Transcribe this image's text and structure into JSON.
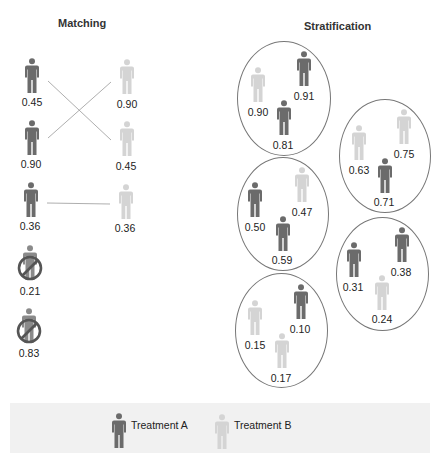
{
  "colors": {
    "treatment_a": "#6b6b6b",
    "treatment_b": "#d4d4d4",
    "line": "#888888",
    "ellipse": "#777777"
  },
  "matching": {
    "title": "Matching",
    "treatment_a": [
      {
        "value": "0.45"
      },
      {
        "value": "0.90"
      },
      {
        "value": "0.36"
      }
    ],
    "treatment_b": [
      {
        "value": "0.90"
      },
      {
        "value": "0.45"
      },
      {
        "value": "0.36"
      }
    ],
    "unmatched": [
      {
        "value": "0.21"
      },
      {
        "value": "0.83"
      }
    ],
    "links": [
      {
        "from": "A 0.45",
        "to": "B 0.45"
      },
      {
        "from": "A 0.90",
        "to": "B 0.90"
      },
      {
        "from": "A 0.36",
        "to": "B 0.36"
      }
    ]
  },
  "stratification": {
    "title": "Stratification",
    "strata": [
      {
        "members": [
          {
            "group": "B",
            "value": "0.90"
          },
          {
            "group": "A",
            "value": "0.91"
          },
          {
            "group": "A",
            "value": "0.81"
          }
        ]
      },
      {
        "members": [
          {
            "group": "B",
            "value": "0.63"
          },
          {
            "group": "B",
            "value": "0.75"
          },
          {
            "group": "A",
            "value": "0.71"
          }
        ]
      },
      {
        "members": [
          {
            "group": "A",
            "value": "0.50"
          },
          {
            "group": "B",
            "value": "0.47"
          },
          {
            "group": "A",
            "value": "0.59"
          }
        ]
      },
      {
        "members": [
          {
            "group": "A",
            "value": "0.31"
          },
          {
            "group": "A",
            "value": "0.38"
          },
          {
            "group": "B",
            "value": "0.24"
          }
        ]
      },
      {
        "members": [
          {
            "group": "B",
            "value": "0.15"
          },
          {
            "group": "A",
            "value": "0.10"
          },
          {
            "group": "B",
            "value": "0.17"
          }
        ]
      }
    ]
  },
  "legend": {
    "items": [
      {
        "label": "Treatment A",
        "icon": "person-icon-dark"
      },
      {
        "label": "Treatment B",
        "icon": "person-icon-light"
      }
    ]
  }
}
